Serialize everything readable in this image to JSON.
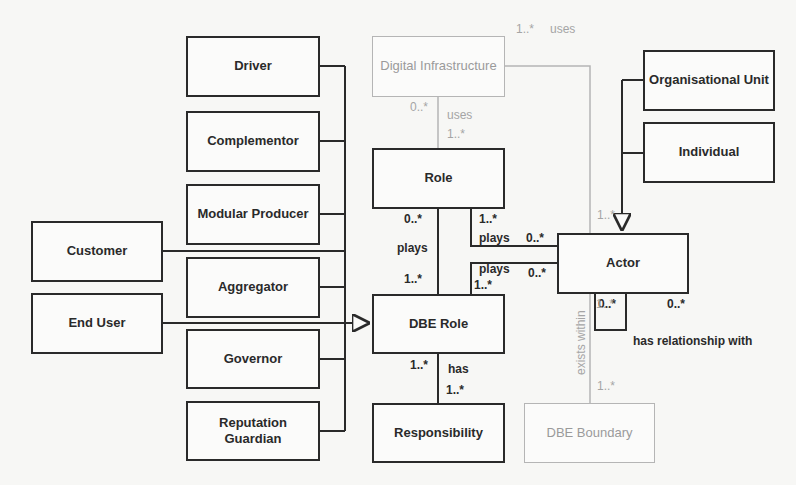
{
  "diagram": {
    "type": "UML class diagram",
    "classes": {
      "driver": "Driver",
      "complementor": "Complementor",
      "modular_producer": "Modular Producer",
      "aggregator": "Aggregator",
      "governor": "Governor",
      "reputation_guardian": "Reputation Guardian",
      "customer": "Customer",
      "end_user": "End User",
      "digital_infrastructure": "Digital Infrastructure",
      "role": "Role",
      "dbe_role": "DBE Role",
      "responsibility": "Responsibility",
      "actor": "Actor",
      "organisational_unit": "Organisational Unit",
      "individual": "Individual",
      "dbe_boundary": "DBE Boundary"
    },
    "associations": {
      "di_actor": {
        "label": "uses",
        "mult_di": "1..*"
      },
      "di_role": {
        "label": "uses",
        "mult_di": "0..*",
        "mult_role": "1..*"
      },
      "role_dberole": {
        "label": "plays",
        "mult_role": "0..*",
        "mult_dberole": "1..*"
      },
      "actor_role": {
        "label": "plays",
        "mult_role": "1..*",
        "mult_actor": "0..*"
      },
      "actor_dberole": {
        "label": "plays",
        "mult_dberole": "1..*",
        "mult_actor": "0..*"
      },
      "dberole_responsibility": {
        "label": "has",
        "mult_dberole": "1..*",
        "mult_responsibility": "1..*"
      },
      "actor_self": {
        "label": "has relationship with",
        "mult_a": "0..*",
        "mult_b": "0..*"
      },
      "actor_boundary": {
        "label": "exists within",
        "mult_actor": "1..*",
        "mult_boundary": "1..*"
      },
      "actor_generalization": {
        "mult": "1..*"
      }
    },
    "colors": {
      "primary_line": "#2a2a2a",
      "secondary_line": "#b5b5b5",
      "background": "#f7f7f5"
    }
  }
}
